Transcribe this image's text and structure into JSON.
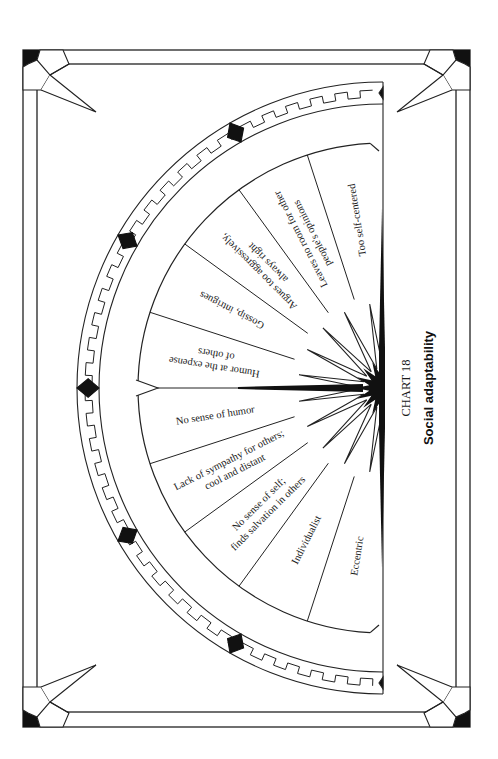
{
  "chart_data": {
    "type": "diagram",
    "title": "Social adaptability",
    "chart_number": "CHART 18",
    "layout": "semicircular wheel, 11 equal segments spanning 180 degrees, page rotated 90 degrees",
    "segments": [
      {
        "label_lines": [
          "Eccentric"
        ]
      },
      {
        "label_lines": [
          "Individualist"
        ]
      },
      {
        "label_lines": [
          "No sense of self;",
          "finds salvation in others"
        ]
      },
      {
        "label_lines": [
          "Lack of sympathy for others;",
          "cool and distant"
        ]
      },
      {
        "label_lines": [
          "No sense of humor"
        ]
      },
      {
        "label_lines": [
          "Humor at the expense",
          "of others"
        ]
      },
      {
        "label_lines": [
          "Gossip, intrigues"
        ]
      },
      {
        "label_lines": [
          "Argues too aggressively,",
          "always right"
        ]
      },
      {
        "label_lines": [
          "Leaves no room for other",
          "people's opinions"
        ]
      },
      {
        "label_lines": [
          "Too self-centered"
        ]
      }
    ],
    "note": "10 labeled segments around the half-wheel; center marked with a black starburst and a pointer at the midpoint"
  },
  "caption": {
    "number": "CHART 18",
    "title": "Social adaptability"
  },
  "colors": {
    "ink": "#111111",
    "paper": "#ffffff"
  }
}
